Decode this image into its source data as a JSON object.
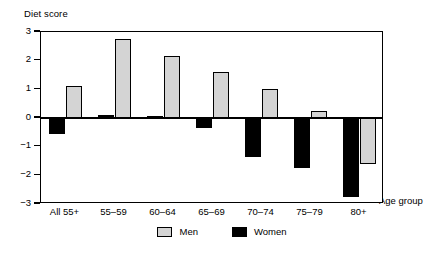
{
  "chart_data": {
    "type": "bar",
    "title": "",
    "ylabel": "Diet score",
    "xlabel": "Age group",
    "categories": [
      "All 55+",
      "55–59",
      "60–64",
      "65–69",
      "70–74",
      "75–79",
      "80+"
    ],
    "series": [
      {
        "name": "Men",
        "color": "#d4d4d4",
        "values": [
          1.1,
          2.75,
          2.15,
          1.6,
          1.0,
          0.25,
          -1.6
        ]
      },
      {
        "name": "Women",
        "color": "#000000",
        "values": [
          -0.55,
          0.12,
          0.08,
          -0.35,
          -1.35,
          -1.75,
          -2.75
        ]
      }
    ],
    "ylim": [
      -3,
      3
    ],
    "yticks": [
      3,
      2,
      1,
      0,
      -1,
      -2,
      -3
    ],
    "ytick_labels": [
      "3",
      "2",
      "1",
      "0",
      "−1",
      "−2",
      "−3"
    ],
    "grid": false,
    "legend_position": "bottom"
  },
  "legend": {
    "items": [
      {
        "label": "Men"
      },
      {
        "label": "Women"
      }
    ]
  }
}
